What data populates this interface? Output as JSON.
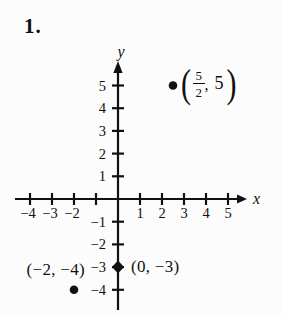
{
  "page": {
    "problem_number": "1."
  },
  "colors": {
    "ink": "#111111",
    "background": "#fcfcfc"
  },
  "chart_data": {
    "type": "scatter",
    "title": "",
    "xlabel": "x",
    "ylabel": "y",
    "xlim": [
      -4.7,
      5.8
    ],
    "ylim": [
      -4.9,
      6.2
    ],
    "grid": false,
    "legend": false,
    "x_ticks": [
      {
        "value": -4,
        "label": "−4"
      },
      {
        "value": -3,
        "label": "−3"
      },
      {
        "value": -2,
        "label": "−2"
      },
      {
        "value": -1,
        "label": ""
      },
      {
        "value": 1,
        "label": "1"
      },
      {
        "value": 2,
        "label": "2"
      },
      {
        "value": 3,
        "label": "3"
      },
      {
        "value": 4,
        "label": "4"
      },
      {
        "value": 5,
        "label": "5"
      }
    ],
    "y_ticks": [
      {
        "value": 5,
        "label": "5"
      },
      {
        "value": 4,
        "label": "4"
      },
      {
        "value": 3,
        "label": "3"
      },
      {
        "value": 2,
        "label": "2"
      },
      {
        "value": 1,
        "label": "1"
      },
      {
        "value": -1,
        "label": "−1"
      },
      {
        "value": -2,
        "label": "−2"
      },
      {
        "value": -3,
        "label": "−3"
      },
      {
        "value": -4,
        "label": "−4"
      }
    ],
    "points": [
      {
        "x": 2.5,
        "y": 5,
        "marker": "dot",
        "label_side": "right",
        "label_text": "(5/2, 5)",
        "label_parts": {
          "open": "(",
          "numerator": "5",
          "denominator": "2",
          "separator": ",",
          "y_value": "5",
          "close": ")"
        }
      },
      {
        "x": 0,
        "y": -3,
        "marker": "diamond",
        "label": "(0, −3)",
        "label_side": "right"
      },
      {
        "x": -2,
        "y": -4,
        "marker": "dot",
        "label": "(−2, −4)",
        "label_side": "above-left"
      }
    ]
  }
}
